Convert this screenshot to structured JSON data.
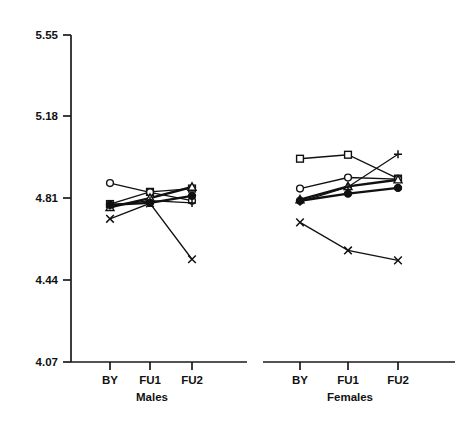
{
  "chart_data": {
    "type": "line",
    "title": "",
    "subtitle": "",
    "xlabel": "",
    "ylabel": "",
    "ylim": [
      4.07,
      5.55
    ],
    "yticks": [
      4.07,
      4.44,
      4.81,
      5.18,
      5.55
    ],
    "ytick_labels": [
      "4.07",
      "4.44",
      "4.81",
      "5.18",
      "5.55"
    ],
    "grid": false,
    "legend": "none",
    "categories": [
      "BY",
      "FU1",
      "FU2"
    ],
    "panels": [
      {
        "name": "Males",
        "label": "Males",
        "series": [
          {
            "name": "open-square",
            "marker": "square-open",
            "values": [
              4.785,
              4.84,
              4.855
            ]
          },
          {
            "name": "open-circle",
            "marker": "circle-open",
            "values": [
              4.88,
              4.838,
              4.8
            ]
          },
          {
            "name": "open-triangle",
            "marker": "triangle-open",
            "values": [
              4.77,
              4.812,
              4.862
            ]
          },
          {
            "name": "filled-circle",
            "marker": "circle-filled",
            "values": [
              4.782,
              4.79,
              4.822
            ]
          },
          {
            "name": "plus",
            "marker": "plus",
            "values": [
              4.778,
              4.8,
              4.79
            ]
          },
          {
            "name": "cross",
            "marker": "cross",
            "values": [
              4.718,
              4.788,
              4.535
            ]
          }
        ]
      },
      {
        "name": "Females",
        "label": "Females",
        "series": [
          {
            "name": "open-square",
            "marker": "square-open",
            "values": [
              4.99,
              5.008,
              4.9
            ]
          },
          {
            "name": "open-circle",
            "marker": "circle-open",
            "values": [
              4.855,
              4.905,
              4.898
            ]
          },
          {
            "name": "open-triangle",
            "marker": "triangle-open",
            "values": [
              4.805,
              4.865,
              4.895
            ]
          },
          {
            "name": "filled-circle",
            "marker": "circle-filled",
            "values": [
              4.8,
              4.832,
              4.858
            ]
          },
          {
            "name": "plus",
            "marker": "plus",
            "values": [
              4.795,
              4.862,
              5.01
            ]
          },
          {
            "name": "cross",
            "marker": "cross",
            "values": [
              4.702,
              4.575,
              4.53
            ]
          }
        ]
      }
    ]
  },
  "axis": {
    "y_ticks": [
      "5.55",
      "5.18",
      "4.81",
      "4.44",
      "4.07"
    ],
    "x_categories": [
      "BY",
      "FU1",
      "FU2"
    ]
  },
  "panel_titles": {
    "left": "Males",
    "right": "Females"
  },
  "colors": {
    "ink": "#111111",
    "background": "#ffffff"
  }
}
